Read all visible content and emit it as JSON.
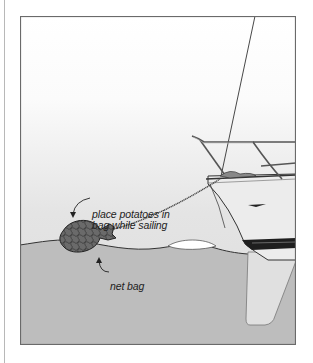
{
  "figure": {
    "annotations": {
      "potatoes_line1": "place potatoes in",
      "potatoes_line2": "bag while sailing",
      "net_bag": "net bag"
    },
    "colors": {
      "sky_top": "#ffffff",
      "sky_bottom": "#dedede",
      "water": "#bdbdbd",
      "hull": "#ececec",
      "net_bag": "#6e6e6e",
      "outline": "#333333",
      "frame": "#6a6a6a"
    }
  }
}
